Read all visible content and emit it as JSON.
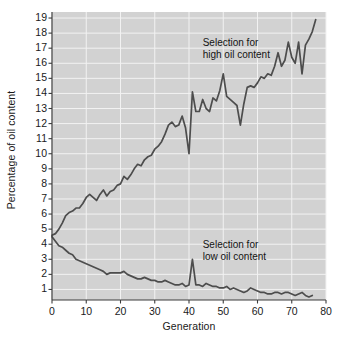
{
  "figure": {
    "background_color": "#ffffff",
    "plot_background_color": "#d2d2d2",
    "gridline_color": "#f2f2f2",
    "axis_color": "#3c3c3c",
    "line_color": "#4d4d4d",
    "text_color": "#1a1a1a"
  },
  "axes": {
    "ylabel": "Percentage of oil content",
    "xlabel": "Generation",
    "ytick_labels": [
      "1",
      "2",
      "3",
      "4",
      "5",
      "6",
      "7",
      "8",
      "9",
      "10",
      "11",
      "12",
      "13",
      "14",
      "15",
      "16",
      "17",
      "18",
      "19"
    ],
    "xtick_labels": [
      "0",
      "10",
      "20",
      "30",
      "40",
      "50",
      "60",
      "70",
      "80"
    ]
  },
  "annotations": {
    "high": "Selection for\nhigh oil content",
    "low": "Selection for\nlow oil content"
  },
  "chart_data": {
    "type": "line",
    "title": "",
    "subtitle": "",
    "xlabel": "Generation",
    "ylabel": "Percentage of oil content",
    "xlim": [
      0,
      80
    ],
    "ylim": [
      0.3,
      19.4
    ],
    "xticks": [
      0,
      10,
      20,
      30,
      40,
      50,
      60,
      70,
      80
    ],
    "yticks": [
      1,
      2,
      3,
      4,
      5,
      6,
      7,
      8,
      9,
      10,
      11,
      12,
      13,
      14,
      15,
      16,
      17,
      18,
      19
    ],
    "grid": true,
    "legend_position": "none",
    "annotations": [
      {
        "text": "Selection for high oil content",
        "x": 44,
        "y": 17.3
      },
      {
        "text": "Selection for low oil content",
        "x": 44,
        "y": 3.9
      }
    ],
    "series": [
      {
        "name": "Selection for high oil content",
        "color": "#4d4d4d",
        "x": [
          0,
          1,
          2,
          3,
          4,
          5,
          6,
          7,
          8,
          9,
          10,
          11,
          12,
          13,
          14,
          15,
          16,
          17,
          18,
          19,
          20,
          21,
          22,
          23,
          24,
          25,
          26,
          27,
          28,
          29,
          30,
          31,
          32,
          33,
          34,
          35,
          36,
          37,
          38,
          39,
          40,
          41,
          42,
          43,
          44,
          45,
          46,
          47,
          48,
          49,
          50,
          51,
          52,
          53,
          54,
          55,
          56,
          57,
          58,
          59,
          60,
          61,
          62,
          63,
          64,
          65,
          66,
          67,
          68,
          69,
          70,
          71,
          72,
          73,
          74,
          75,
          76,
          77
        ],
        "values": [
          4.6,
          4.7,
          5.0,
          5.4,
          5.9,
          6.1,
          6.2,
          6.4,
          6.4,
          6.7,
          7.1,
          7.3,
          7.1,
          6.9,
          7.3,
          7.6,
          7.2,
          7.5,
          7.6,
          7.9,
          8.0,
          8.5,
          8.3,
          8.6,
          9.0,
          9.3,
          9.2,
          9.6,
          9.8,
          9.9,
          10.3,
          10.5,
          10.8,
          11.3,
          11.9,
          12.1,
          11.8,
          11.9,
          12.5,
          11.7,
          10.0,
          14.1,
          12.8,
          12.8,
          13.6,
          13.0,
          12.8,
          13.7,
          13.5,
          14.2,
          15.3,
          13.8,
          13.6,
          13.4,
          13.2,
          11.9,
          13.3,
          14.4,
          14.5,
          14.4,
          14.7,
          15.1,
          15.0,
          15.3,
          15.2,
          15.8,
          16.7,
          15.8,
          16.2,
          17.4,
          16.4,
          16.0,
          17.4,
          15.3,
          17.2,
          17.6,
          18.1,
          18.9
        ]
      },
      {
        "name": "Selection for low oil content",
        "color": "#4d4d4d",
        "x": [
          0,
          1,
          2,
          3,
          4,
          5,
          6,
          7,
          8,
          9,
          10,
          11,
          12,
          13,
          14,
          15,
          16,
          17,
          18,
          19,
          20,
          21,
          22,
          23,
          24,
          25,
          26,
          27,
          28,
          29,
          30,
          31,
          32,
          33,
          34,
          35,
          36,
          37,
          38,
          39,
          40,
          41,
          42,
          43,
          44,
          45,
          46,
          47,
          48,
          49,
          50,
          51,
          52,
          53,
          54,
          55,
          56,
          57,
          58,
          59,
          60,
          61,
          62,
          63,
          64,
          65,
          66,
          67,
          68,
          69,
          70,
          71,
          72,
          73,
          74,
          75,
          76
        ],
        "values": [
          4.5,
          4.2,
          3.9,
          3.8,
          3.6,
          3.4,
          3.3,
          3.0,
          2.9,
          2.8,
          2.7,
          2.6,
          2.5,
          2.4,
          2.3,
          2.2,
          2.0,
          2.1,
          2.1,
          2.1,
          2.1,
          2.2,
          2.0,
          1.9,
          1.8,
          1.7,
          1.7,
          1.8,
          1.7,
          1.6,
          1.6,
          1.5,
          1.5,
          1.6,
          1.5,
          1.4,
          1.3,
          1.3,
          1.4,
          1.2,
          1.3,
          3.0,
          1.3,
          1.3,
          1.2,
          1.4,
          1.3,
          1.2,
          1.2,
          1.1,
          1.1,
          1.2,
          1.0,
          1.1,
          1.0,
          0.9,
          0.8,
          0.9,
          1.1,
          1.0,
          0.9,
          0.8,
          0.8,
          0.7,
          0.7,
          0.8,
          0.8,
          0.7,
          0.8,
          0.8,
          0.7,
          0.6,
          0.7,
          0.8,
          0.6,
          0.5,
          0.6
        ]
      }
    ]
  }
}
